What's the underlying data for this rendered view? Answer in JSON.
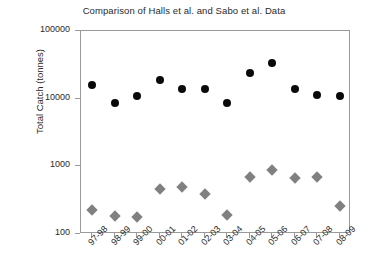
{
  "chart_data": {
    "type": "scatter",
    "title": "Comparison of Halls et al. and Sabo et al. Data",
    "xlabel": "",
    "ylabel": "Total Catch (tonnes)",
    "yscale": "log",
    "ylim": [
      100,
      100000
    ],
    "ytick_labels": [
      "100000",
      "10000",
      "1000",
      "100"
    ],
    "ytick_values": [
      100000,
      10000,
      1000,
      100
    ],
    "grid": false,
    "legend": "none",
    "categories": [
      "97-98",
      "98-99",
      "99-00",
      "00-01",
      "01-02",
      "02-03",
      "03-04",
      "04-05",
      "05-06",
      "06-07",
      "07-08",
      "08-09"
    ],
    "series": [
      {
        "name": "Halls et al.",
        "marker": "circle",
        "color": "#0a0a0a",
        "values": [
          16000,
          8500,
          11000,
          19000,
          14000,
          14000,
          8500,
          24000,
          34000,
          14000,
          11500,
          11000
        ]
      },
      {
        "name": "Sabo et al.",
        "marker": "diamond",
        "color": "#808080",
        "values": [
          230,
          185,
          180,
          460,
          490,
          390,
          190,
          700,
          880,
          680,
          700,
          260
        ]
      }
    ]
  }
}
